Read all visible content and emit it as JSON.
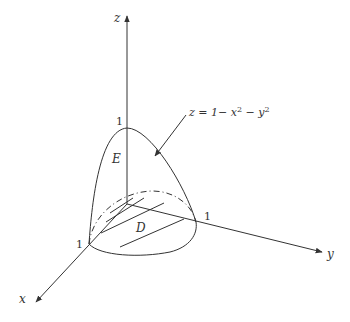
{
  "figure": {
    "axes": {
      "x_label": "x",
      "y_label": "y",
      "z_label": "z"
    },
    "ticks": {
      "z_one": "1",
      "y_one": "1",
      "x_one": "1"
    },
    "region_labels": {
      "solid": "E",
      "domain": "D"
    },
    "equation": {
      "prefix": "z = 1− x",
      "sup1": "2",
      "mid": " − y",
      "sup2": "2"
    },
    "colors": {
      "stroke": "#333333",
      "background": "#ffffff"
    }
  }
}
